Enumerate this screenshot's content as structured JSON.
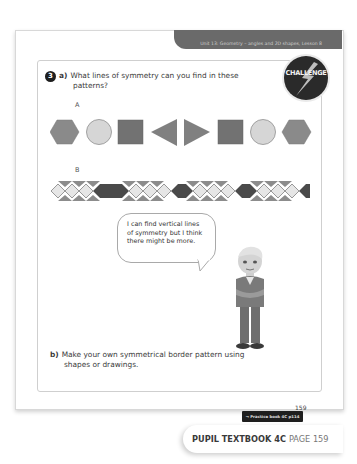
{
  "header": {
    "unit_title": "Unit 13: Geometry – angles and 2D shapes, Lesson 8"
  },
  "challenge_badge": {
    "label": "CHALLENGE",
    "icon": "lightning-bolt-icon"
  },
  "question": {
    "number": "3",
    "part_a": {
      "letter": "a)",
      "text_line1": "What lines of symmetry can you find in these",
      "text_line2": "patterns?"
    },
    "pattern_a": {
      "label": "A",
      "shapes": [
        "hexagon",
        "circle",
        "square",
        "triangle-left",
        "triangle-right",
        "square",
        "circle",
        "hexagon"
      ]
    },
    "pattern_b": {
      "label": "B",
      "description": "Border band of diamonds: groups of three light diamonds separated by long dark diamonds, with grey triangles above and below"
    },
    "speech_bubble": {
      "line1": "I can find vertical lines",
      "line2": "of symmetry but I think",
      "line3": "there might be more."
    },
    "part_b": {
      "letter": "b)",
      "text_line1": "Make your own symmetrical border pattern using",
      "text_line2": "shapes or drawings."
    }
  },
  "footer": {
    "practice_link": "→ Practice book 4C p114",
    "page_number": "159",
    "book_title": "PUPIL TEXTBOOK 4C",
    "page_label": "PAGE 159"
  },
  "colors": {
    "hexagon": "#8a8a8a",
    "circle": "#d6d6d6",
    "square": "#727272",
    "triangle": "#808080",
    "dark_diamond": "#4a4a4a",
    "light_diamond": "#e6e6e6",
    "mid_triangle": "#8c8c8c"
  }
}
